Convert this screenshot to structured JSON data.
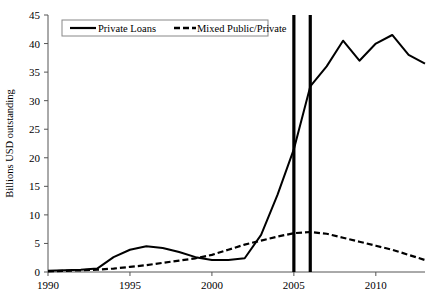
{
  "chart_data": {
    "type": "line",
    "title": "",
    "xlabel": "",
    "ylabel": "Billions USD outstanding",
    "xlim": [
      1990,
      2013
    ],
    "ylim": [
      0,
      45
    ],
    "ytick_labels": [
      "0",
      "5",
      "10",
      "15",
      "20",
      "25",
      "30",
      "35",
      "40",
      "45"
    ],
    "ytick_values": [
      0,
      5,
      10,
      15,
      20,
      25,
      30,
      35,
      40,
      45
    ],
    "xtick_labels": [
      "1990",
      "1995",
      "2000",
      "2005",
      "2010"
    ],
    "xtick_values": [
      1990,
      1995,
      2000,
      2005,
      2010
    ],
    "grid": false,
    "legend_position": "top-left",
    "x": [
      1990,
      1991,
      1992,
      1993,
      1994,
      1995,
      1996,
      1997,
      1998,
      1999,
      2000,
      2001,
      2002,
      2003,
      2004,
      2005,
      2006,
      2007,
      2008,
      2009,
      2010,
      2011,
      2012,
      2013
    ],
    "series": [
      {
        "name": "Private Loans",
        "style": "solid",
        "color": "#000000",
        "values": [
          0.2,
          0.3,
          0.4,
          0.6,
          2.6,
          3.9,
          4.5,
          4.2,
          3.5,
          2.6,
          2.1,
          2.1,
          2.4,
          6.5,
          13.5,
          21.5,
          32.5,
          36.0,
          40.5,
          37.0,
          40.0,
          41.5,
          38.0,
          36.5
        ]
      },
      {
        "name": "Mixed Public/Private",
        "style": "dashed",
        "color": "#000000",
        "values": [
          0.1,
          0.2,
          0.3,
          0.4,
          0.6,
          0.9,
          1.2,
          1.6,
          2.0,
          2.4,
          3.0,
          3.9,
          4.8,
          5.5,
          6.2,
          6.8,
          7.0,
          6.7,
          6.0,
          5.3,
          4.6,
          3.9,
          3.0,
          2.1
        ]
      }
    ],
    "annotations": [
      {
        "name": "vertical-marker-2005",
        "type": "vline",
        "x": 2005,
        "color": "#000000"
      },
      {
        "name": "vertical-marker-2006",
        "type": "vline",
        "x": 2006,
        "color": "#000000"
      }
    ],
    "legend": [
      {
        "label": "Private Loans",
        "style": "solid"
      },
      {
        "label": "Mixed Public/Private",
        "style": "dashed"
      }
    ]
  }
}
